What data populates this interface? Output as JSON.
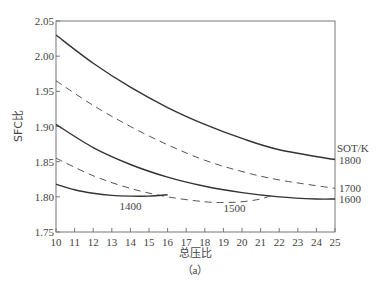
{
  "chart_data": {
    "type": "line",
    "title": "",
    "caption": "（a）",
    "xlabel": "总压比",
    "ylabel": "SFC比",
    "xlim": [
      10,
      25
    ],
    "ylim": [
      1.75,
      2.05
    ],
    "xticks": [
      10,
      11,
      12,
      13,
      14,
      15,
      16,
      17,
      18,
      19,
      20,
      21,
      22,
      23,
      24,
      25
    ],
    "yticks": [
      1.75,
      1.8,
      1.85,
      1.9,
      1.95,
      2.0,
      2.05
    ],
    "ytick_labels": [
      "1.75",
      "1.80",
      "1.85",
      "1.90",
      "1.95",
      "2.00",
      "2.05"
    ],
    "grid": false,
    "legend_title": "SOT/K",
    "series": [
      {
        "name": "1800",
        "style": "solid",
        "x": [
          10,
          12,
          14,
          16,
          18,
          20,
          22,
          25
        ],
        "y": [
          2.03,
          1.99,
          1.956,
          1.927,
          1.903,
          1.883,
          1.867,
          1.853
        ]
      },
      {
        "name": "1700",
        "style": "dashed",
        "x": [
          10,
          12,
          14,
          16,
          18,
          20,
          22,
          25
        ],
        "y": [
          1.965,
          1.93,
          1.9,
          1.874,
          1.852,
          1.836,
          1.824,
          1.812
        ]
      },
      {
        "name": "1600",
        "style": "solid",
        "x": [
          10,
          12,
          14,
          16,
          18,
          20,
          22,
          24,
          25
        ],
        "y": [
          1.903,
          1.87,
          1.846,
          1.828,
          1.815,
          1.806,
          1.8,
          1.797,
          1.797
        ]
      },
      {
        "name": "1500",
        "style": "dashed",
        "x": [
          10,
          12,
          14,
          16,
          18,
          19,
          20,
          21,
          21.8
        ],
        "y": [
          1.855,
          1.83,
          1.812,
          1.8,
          1.793,
          1.792,
          1.793,
          1.797,
          1.804
        ]
      },
      {
        "name": "1400",
        "style": "solid",
        "x": [
          10,
          11,
          12,
          13,
          14,
          15,
          16
        ],
        "y": [
          1.818,
          1.81,
          1.805,
          1.802,
          1.801,
          1.801,
          1.803
        ]
      }
    ],
    "annotations": [
      {
        "text": "1400",
        "x": 14.0,
        "y": 1.787
      },
      {
        "text": "1500",
        "x": 19.6,
        "y": 1.784
      }
    ]
  }
}
